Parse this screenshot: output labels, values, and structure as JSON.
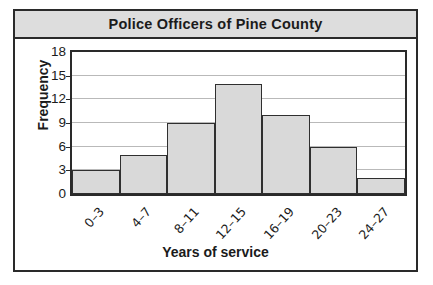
{
  "chart_data": {
    "type": "bar",
    "title": "Police Officers of Pine County",
    "xlabel": "Years of service",
    "ylabel": "Frequency",
    "categories": [
      "0–3",
      "4–7",
      "8–11",
      "12–15",
      "16–19",
      "20–23",
      "24–27"
    ],
    "values": [
      3,
      5,
      9,
      14,
      10,
      6,
      2
    ],
    "ylim": [
      0,
      18
    ],
    "ytick_labels": [
      "18",
      "15",
      "12",
      "9",
      "6",
      "3",
      "0"
    ],
    "ytick_values": [
      18,
      15,
      12,
      9,
      6,
      3,
      0
    ],
    "ytick_step": 3,
    "grid": "horizontal",
    "legend": "none",
    "bar_fill_color": "#d9d9d9",
    "bar_edge_color": "#2f2f2f",
    "title_band_color": "#dddddd",
    "frame_color": "#2a2a2a",
    "gridline_color": "#b9b9b9"
  }
}
